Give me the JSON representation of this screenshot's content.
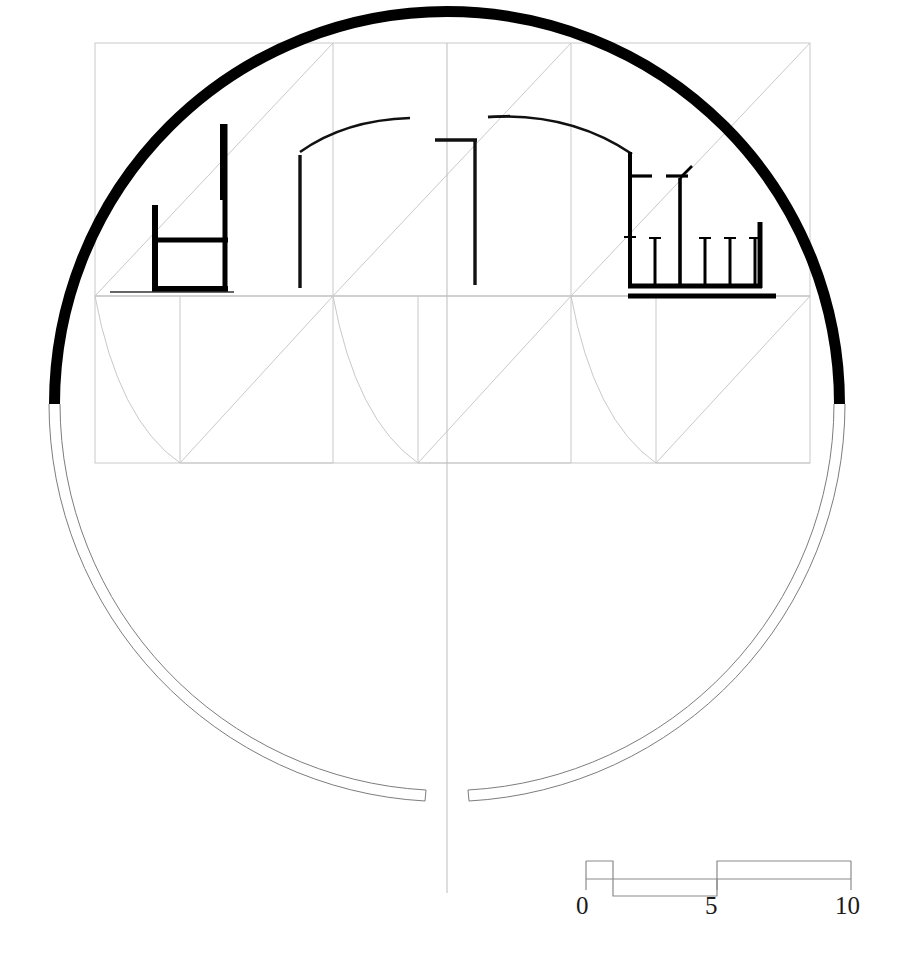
{
  "drawing": {
    "title": "Architectural plan — circular church / rotunda",
    "type": "architectural-plan",
    "background_color": "#ffffff",
    "ink_color": "#000000",
    "construction_line_color": "#c8c8c8",
    "thin_line_color": "#555555"
  },
  "scale_bar": {
    "name": "graphic-scale-bar",
    "unit_ticks": [
      "0",
      "5",
      "10"
    ],
    "tick_positions_px": [
      586,
      717,
      851
    ],
    "baseline_y_px": 879,
    "block_height_px": 22,
    "segments": [
      {
        "from": "0",
        "to": "1",
        "side": "above"
      },
      {
        "from": "1",
        "to": "5",
        "side": "below"
      },
      {
        "from": "5",
        "to": "10",
        "side": "above"
      }
    ],
    "color": "#8a8a8a"
  },
  "geometry": {
    "main_circle": {
      "name": "main-rotunda-circle",
      "center_x": 447,
      "center_y": 404,
      "radius": 398,
      "heavy_arc_from_deg": 180,
      "heavy_arc_to_deg": 360,
      "heavy_stroke_px": 11,
      "light_double_stroke_px": 1
    },
    "grid": {
      "name": "construction-grid",
      "left_x": 95,
      "right_x": 810,
      "top_y": 43,
      "mid_y": 296,
      "bottom_y": 463,
      "columns_x": [
        95,
        333,
        571,
        810
      ],
      "diagonals": true
    },
    "center_line_x": 447
  },
  "features": {
    "left_chamber": {
      "name": "left-chamber-walls",
      "description": "thick L-shaped wall block with internal partition"
    },
    "center_bay": {
      "name": "center-bay-walls",
      "description": "two vertical piers with lintel and segmental arch"
    },
    "right_apse": {
      "name": "right-apse-colonnade",
      "description": "enclosed apse with five column stubs on a heavy plinth"
    },
    "pendentives": {
      "name": "pendentive-curves",
      "count": 3,
      "description": "light curved construction arcs in lower grid cells"
    }
  }
}
